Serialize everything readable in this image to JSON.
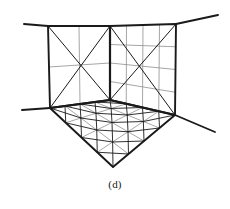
{
  "figure": {
    "caption": "(d)",
    "background_color": "#ffffff",
    "stroke_dark": "#1a1a1a",
    "stroke_mid": "#555555",
    "stroke_light": "#8f8f8f",
    "width": 230,
    "height": 209
  },
  "chart_data": {
    "type": "diagram",
    "projection": "two-point perspective",
    "vertices": {
      "corner_top": [
        110,
        26
      ],
      "corner_bottom": [
        110,
        100
      ],
      "left_wall_top_outer": [
        48,
        26
      ],
      "left_wall_bottom_outer": [
        50,
        108
      ],
      "right_wall_top_outer": [
        176,
        24
      ],
      "right_wall_bottom_outer": [
        175,
        115
      ],
      "floor_front": [
        113,
        167
      ],
      "left_eave_end": [
        24,
        24
      ],
      "right_eave_end": [
        218,
        15
      ],
      "left_baseline_end": [
        22,
        110
      ],
      "right_baseline_end": [
        215,
        132
      ]
    },
    "planes": [
      {
        "name": "left-wall",
        "quad": [
          [
            48,
            26
          ],
          [
            110,
            26
          ],
          [
            110,
            100
          ],
          [
            50,
            108
          ]
        ],
        "cols": 2,
        "rows": 2,
        "diagonals": "both",
        "diagonal_scope": "full-plane"
      },
      {
        "name": "right-wall",
        "quad": [
          [
            110,
            26
          ],
          [
            176,
            24
          ],
          [
            175,
            115
          ],
          [
            110,
            100
          ]
        ],
        "cols": 4,
        "rows": 4,
        "diagonals": "both",
        "diagonal_scope": "full-plane"
      },
      {
        "name": "floor",
        "quad": [
          [
            50,
            108
          ],
          [
            110,
            100
          ],
          [
            175,
            115
          ],
          [
            113,
            167
          ]
        ],
        "cols": 4,
        "rows": 4,
        "diagonals": "both",
        "diagonal_scope": "per-cell"
      }
    ],
    "extension_lines": [
      {
        "name": "left-eave",
        "from": [
          24,
          24
        ],
        "to": [
          48,
          26
        ]
      },
      {
        "name": "right-eave",
        "from": [
          176,
          24
        ],
        "to": [
          218,
          15
        ]
      },
      {
        "name": "left-baseline",
        "from": [
          22,
          110
        ],
        "to": [
          50,
          108
        ]
      },
      {
        "name": "right-baseline",
        "from": [
          175,
          115
        ],
        "to": [
          215,
          132
        ]
      }
    ],
    "xlabel": "",
    "ylabel": "",
    "legend": []
  }
}
